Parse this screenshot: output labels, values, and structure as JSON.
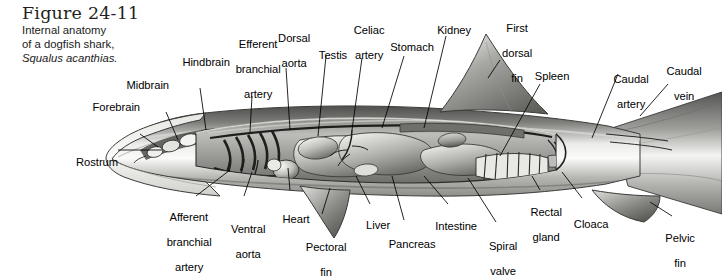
{
  "figure": {
    "number": "Figure 24-11",
    "caption_line1": "Internal anatomy",
    "caption_line2": "of a dogfish shark,",
    "species": "Squalus acanthias."
  },
  "colors": {
    "background": "#ffffff",
    "ink": "#000000",
    "body_light": "#f2f2f0",
    "body_mid": "#9a9a98",
    "body_dark": "#4a4a4a",
    "organ_light": "#d8d8d4",
    "organ_mid": "#8e8e8a"
  },
  "labels": [
    {
      "id": "rostrum",
      "text": "Rostrum",
      "lines": [
        "Rostrum"
      ]
    },
    {
      "id": "forebrain",
      "text": "Forebrain",
      "lines": [
        "Forebrain"
      ]
    },
    {
      "id": "midbrain",
      "text": "Midbrain",
      "lines": [
        "Midbrain"
      ]
    },
    {
      "id": "hindbrain",
      "text": "Hindbrain",
      "lines": [
        "Hindbrain"
      ]
    },
    {
      "id": "efferent-branchial-artery",
      "text": "Efferent branchial artery",
      "lines": [
        "Efferent",
        "branchial",
        "artery"
      ]
    },
    {
      "id": "dorsal-aorta",
      "text": "Dorsal aorta",
      "lines": [
        "Dorsal",
        "aorta"
      ]
    },
    {
      "id": "testis",
      "text": "Testis",
      "lines": [
        "Testis"
      ]
    },
    {
      "id": "celiac-artery",
      "text": "Celiac artery",
      "lines": [
        "Celiac",
        "artery"
      ]
    },
    {
      "id": "stomach",
      "text": "Stomach",
      "lines": [
        "Stomach"
      ]
    },
    {
      "id": "kidney",
      "text": "Kidney",
      "lines": [
        "Kidney"
      ]
    },
    {
      "id": "first-dorsal-fin",
      "text": "First dorsal fin",
      "lines": [
        "First",
        "dorsal",
        "fin"
      ]
    },
    {
      "id": "spleen",
      "text": "Spleen",
      "lines": [
        "Spleen"
      ]
    },
    {
      "id": "caudal-artery",
      "text": "Caudal artery",
      "lines": [
        "Caudal",
        "artery"
      ]
    },
    {
      "id": "caudal-vein",
      "text": "Caudal vein",
      "lines": [
        "Caudal",
        "vein"
      ]
    },
    {
      "id": "afferent-branchial-artery",
      "text": "Afferent branchial artery",
      "lines": [
        "Afferent",
        "branchial",
        "artery"
      ]
    },
    {
      "id": "ventral-aorta",
      "text": "Ventral aorta",
      "lines": [
        "Ventral",
        "aorta"
      ]
    },
    {
      "id": "heart",
      "text": "Heart",
      "lines": [
        "Heart"
      ]
    },
    {
      "id": "pectoral-fin",
      "text": "Pectoral fin",
      "lines": [
        "Pectoral",
        "fin"
      ]
    },
    {
      "id": "liver",
      "text": "Liver",
      "lines": [
        "Liver"
      ]
    },
    {
      "id": "pancreas",
      "text": "Pancreas",
      "lines": [
        "Pancreas"
      ]
    },
    {
      "id": "intestine",
      "text": "Intestine",
      "lines": [
        "Intestine"
      ]
    },
    {
      "id": "spiral-valve",
      "text": "Spiral valve",
      "lines": [
        "Spiral",
        "valve"
      ]
    },
    {
      "id": "rectal-gland",
      "text": "Rectal gland",
      "lines": [
        "Rectal",
        "gland"
      ]
    },
    {
      "id": "cloaca",
      "text": "Cloaca",
      "lines": [
        "Cloaca"
      ]
    },
    {
      "id": "pelvic-fin",
      "text": "Pelvic fin",
      "lines": [
        "Pelvic",
        "fin"
      ]
    }
  ]
}
